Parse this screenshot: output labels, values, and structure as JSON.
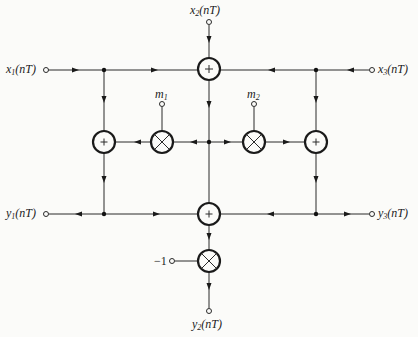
{
  "diagram": {
    "type": "signal-flow-graph",
    "inputs": {
      "x1": {
        "name": "x",
        "sub": "1",
        "arg": "(nT)"
      },
      "x2": {
        "name": "x",
        "sub": "2",
        "arg": "(nT)"
      },
      "x3": {
        "name": "x",
        "sub": "3",
        "arg": "(nT)"
      }
    },
    "outputs": {
      "y1": {
        "name": "y",
        "sub": "1",
        "arg": "(nT)"
      },
      "y2": {
        "name": "y",
        "sub": "2",
        "arg": "(nT)"
      },
      "y3": {
        "name": "y",
        "sub": "3",
        "arg": "(nT)"
      }
    },
    "coefficients": {
      "m1": {
        "name": "m",
        "sub": "1"
      },
      "m2": {
        "name": "m",
        "sub": "2"
      },
      "neg": {
        "value": "−1"
      }
    },
    "adders": [
      {
        "id": "adder-top",
        "symbol": "+"
      },
      {
        "id": "adder-left",
        "symbol": "+"
      },
      {
        "id": "adder-right",
        "symbol": "+"
      },
      {
        "id": "adder-bottom",
        "symbol": "+"
      }
    ],
    "multipliers": [
      {
        "id": "multiplier-m1",
        "coefficient": "m1"
      },
      {
        "id": "multiplier-m2",
        "coefficient": "m2"
      },
      {
        "id": "multiplier-neg1",
        "coefficient": "−1"
      }
    ]
  }
}
